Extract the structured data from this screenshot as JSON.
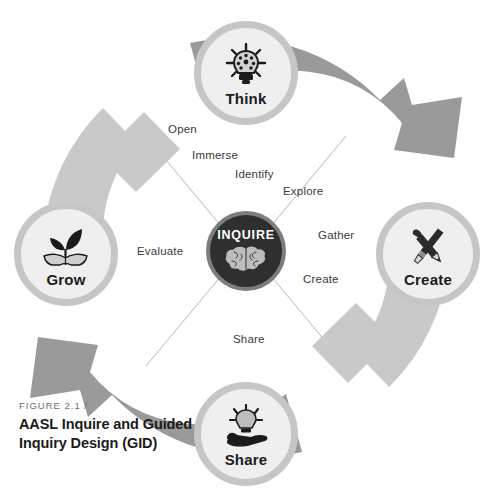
{
  "figure": {
    "eyebrow": "FIGURE 2.1 /",
    "title": "AASL Inquire and Guided Inquiry Design (GID)"
  },
  "hub": {
    "label": "INQUIRE",
    "icon": "brain-icon"
  },
  "nodes": [
    {
      "id": "think",
      "label": "Think",
      "icon": "lightbulb-icon",
      "position": "top"
    },
    {
      "id": "create",
      "label": "Create",
      "icon": "pencil-brush-icon",
      "position": "right"
    },
    {
      "id": "share",
      "label": "Share",
      "icon": "hand-lightbulb-icon",
      "position": "bottom"
    },
    {
      "id": "grow",
      "label": "Grow",
      "icon": "sprout-book-icon",
      "position": "left"
    }
  ],
  "phases": [
    {
      "id": "open",
      "label": "Open"
    },
    {
      "id": "immerse",
      "label": "Immerse"
    },
    {
      "id": "identify",
      "label": "Identify"
    },
    {
      "id": "explore",
      "label": "Explore"
    },
    {
      "id": "gather",
      "label": "Gather"
    },
    {
      "id": "create",
      "label": "Create"
    },
    {
      "id": "share",
      "label": "Share"
    },
    {
      "id": "evaluate",
      "label": "Evaluate"
    }
  ],
  "colors": {
    "arrow_dark": "#9a9a9a",
    "arrow_light": "#c9c9c9",
    "node_ring": "#c6c6c6",
    "node_fill": "#efefef",
    "hub_fill": "#2f2f2f",
    "hub_ring": "#7d7d7d",
    "spoke_line": "#b0b0b0",
    "text_dark": "#1b1b1b",
    "text_muted": "#6e6e6e",
    "background": "#ffffff"
  }
}
